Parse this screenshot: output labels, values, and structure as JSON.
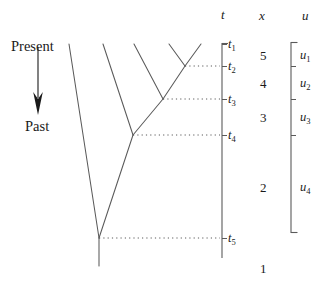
{
  "figure": {
    "type": "coalescent-genealogy-diagram",
    "width": 325,
    "height": 286,
    "background": "#ffffff",
    "line_color": "#555555",
    "text_color": "#1a1a1a"
  },
  "direction_labels": {
    "present": "Present",
    "past": "Past"
  },
  "column_headers": {
    "t": "t",
    "x": "x",
    "u": "u"
  },
  "time_axis": {
    "x_px": 222,
    "top_px": 43,
    "bottom_px": 258,
    "ticks": [
      {
        "id": "t1",
        "base": "t",
        "sub": "1",
        "y_px": 44
      },
      {
        "id": "t2",
        "base": "t",
        "sub": "2",
        "y_px": 66
      },
      {
        "id": "t3",
        "base": "t",
        "sub": "3",
        "y_px": 99
      },
      {
        "id": "t4",
        "base": "t",
        "sub": "4",
        "y_px": 135
      },
      {
        "id": "t5",
        "base": "t",
        "sub": "5",
        "y_px": 238
      }
    ]
  },
  "lineage_counts": [
    {
      "value": "5",
      "y_px": 55
    },
    {
      "value": "4",
      "y_px": 83
    },
    {
      "value": "3",
      "y_px": 117
    },
    {
      "value": "2",
      "y_px": 187
    },
    {
      "value": "1",
      "y_px": 268
    }
  ],
  "u_bracket": {
    "x_px": 291,
    "top_px": 42,
    "bottom_px": 233,
    "tick_ys": [
      66,
      99,
      135
    ],
    "labels": [
      {
        "id": "u1",
        "base": "u",
        "sub": "1",
        "y_px": 55
      },
      {
        "id": "u2",
        "base": "u",
        "sub": "2",
        "y_px": 83
      },
      {
        "id": "u3",
        "base": "u",
        "sub": "3",
        "y_px": 117
      },
      {
        "id": "u4",
        "base": "u",
        "sub": "4",
        "y_px": 187
      }
    ]
  },
  "tips": [
    {
      "name": "tip-1",
      "x_px": 69,
      "y_px": 44
    },
    {
      "name": "tip-2",
      "x_px": 103,
      "y_px": 44
    },
    {
      "name": "tip-3",
      "x_px": 134,
      "y_px": 44
    },
    {
      "name": "tip-4",
      "x_px": 169,
      "y_px": 44
    },
    {
      "name": "tip-5",
      "x_px": 201,
      "y_px": 44
    }
  ],
  "coalescent_nodes": [
    {
      "name": "node-t2",
      "x_px": 185,
      "y_px": 66
    },
    {
      "name": "node-t3",
      "x_px": 163,
      "y_px": 99
    },
    {
      "name": "node-t4",
      "x_px": 133,
      "y_px": 135
    },
    {
      "name": "node-t5",
      "x_px": 99,
      "y_px": 238
    }
  ],
  "tree_edges": [
    {
      "name": "edge-tip1-root",
      "x1": 69,
      "y1": 44,
      "x2": 99,
      "y2": 238
    },
    {
      "name": "edge-tip2-t4",
      "x1": 103,
      "y1": 44,
      "x2": 133,
      "y2": 135
    },
    {
      "name": "edge-tip3-t3",
      "x1": 134,
      "y1": 44,
      "x2": 163,
      "y2": 99
    },
    {
      "name": "edge-tip4-t2",
      "x1": 169,
      "y1": 44,
      "x2": 185,
      "y2": 66
    },
    {
      "name": "edge-tip5-t2",
      "x1": 201,
      "y1": 44,
      "x2": 185,
      "y2": 66
    },
    {
      "name": "edge-t2-t3",
      "x1": 185,
      "y1": 66,
      "x2": 163,
      "y2": 99
    },
    {
      "name": "edge-t3-t4",
      "x1": 163,
      "y1": 99,
      "x2": 133,
      "y2": 135
    },
    {
      "name": "edge-t4-t5",
      "x1": 133,
      "y1": 135,
      "x2": 99,
      "y2": 238
    },
    {
      "name": "edge-root-stem",
      "x1": 99,
      "y1": 238,
      "x2": 99,
      "y2": 266
    }
  ],
  "dotted_connectors": [
    {
      "name": "connector-t2",
      "x1": 185,
      "x2": 220,
      "y": 66
    },
    {
      "name": "connector-t3",
      "x1": 163,
      "x2": 220,
      "y": 99
    },
    {
      "name": "connector-t4",
      "x1": 133,
      "x2": 220,
      "y": 135
    },
    {
      "name": "connector-t5",
      "x1": 99,
      "x2": 220,
      "y": 238
    }
  ],
  "time_arrow": {
    "x_px": 38,
    "top_px": 47,
    "bottom_px": 113
  }
}
